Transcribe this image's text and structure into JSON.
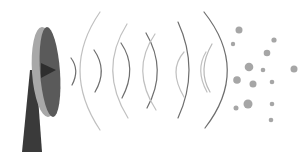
{
  "illustration": {
    "subject": "satellite-dish-emitting-signal-waves",
    "colors": {
      "background": "#ffffff",
      "dish_dark": "#4a4a4a",
      "dish_light": "#a8a8a8",
      "mast": "#3a3a3a",
      "wave_dark": "#6e6e6e",
      "wave_light": "#b8b8b8",
      "particles": "#a0a0a0"
    }
  }
}
